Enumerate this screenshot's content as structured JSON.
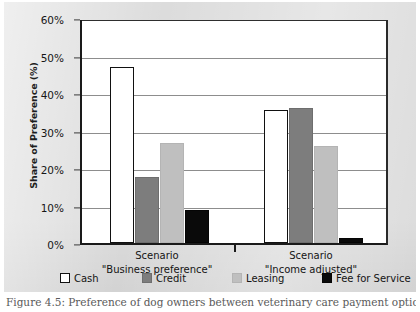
{
  "figure": {
    "caption": "Figure 4.5: Preference of dog owners between veterinary care payment options"
  },
  "chart_data": {
    "type": "bar",
    "title": "",
    "xlabel": "",
    "ylabel": "Share of Preference (%)",
    "ylim": [
      0,
      60
    ],
    "ytick_labels": [
      "0%",
      "10%",
      "20%",
      "30%",
      "40%",
      "50%",
      "60%"
    ],
    "ytick_values": [
      0,
      10,
      20,
      30,
      40,
      50,
      60
    ],
    "grid": true,
    "legend_position": "bottom",
    "categories": [
      "Scenario \"Business preference\"",
      "Scenario \"Income adjusted\""
    ],
    "category_lines": [
      {
        "line1": "Scenario",
        "line2": "\"Business preference\""
      },
      {
        "line1": "Scenario",
        "line2": "\"Income adjusted\""
      }
    ],
    "series": [
      {
        "name": "Cash",
        "key": "cash",
        "color": "#ffffff",
        "values": [
          47.0,
          35.5
        ]
      },
      {
        "name": "Credit",
        "key": "credit",
        "color": "#7d7d7d",
        "values": [
          17.6,
          36.1
        ]
      },
      {
        "name": "Leasing",
        "key": "leasing",
        "color": "#bfbfbf",
        "values": [
          26.6,
          26.0
        ]
      },
      {
        "name": "Fee for Service",
        "key": "fee",
        "color": "#0a0a0a",
        "values": [
          8.7,
          1.3
        ]
      }
    ]
  }
}
